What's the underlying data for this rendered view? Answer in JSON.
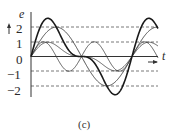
{
  "figure": {
    "caption": "(c)",
    "y_axis_label": "e",
    "x_axis_label": "t",
    "y_ticks": [
      "2",
      "1",
      "0",
      "−1",
      "−2"
    ],
    "colors": {
      "line": "#2a2a2a",
      "grid": "#555555",
      "background": "#ffffff"
    }
  },
  "chart_data": {
    "type": "line",
    "title": "",
    "caption": "(c)",
    "xlabel": "t",
    "ylabel": "e",
    "ylim": [
      -2.8,
      2.8
    ],
    "yticks": [
      2,
      1,
      0,
      -1,
      -2
    ],
    "reference_lines": [
      2,
      1,
      0,
      -1,
      -2
    ],
    "x_periods_shown": 1.25,
    "series": [
      {
        "name": "fundamental (amplitude 2)",
        "formula": "2 sin(ωt)",
        "style": "medium"
      },
      {
        "name": "second harmonic (amplitude 1)",
        "formula": "sin(2ωt)",
        "style": "thin"
      },
      {
        "name": "scaled composite (amplitude ~1)",
        "formula": "0.75(sin(ωt) + 0.5 sin(2ωt))",
        "style": "thin"
      },
      {
        "name": "resultant (sum)",
        "formula": "2 sin(ωt) + sin(2ωt)",
        "style": "bold",
        "peak": 2.6
      }
    ]
  }
}
